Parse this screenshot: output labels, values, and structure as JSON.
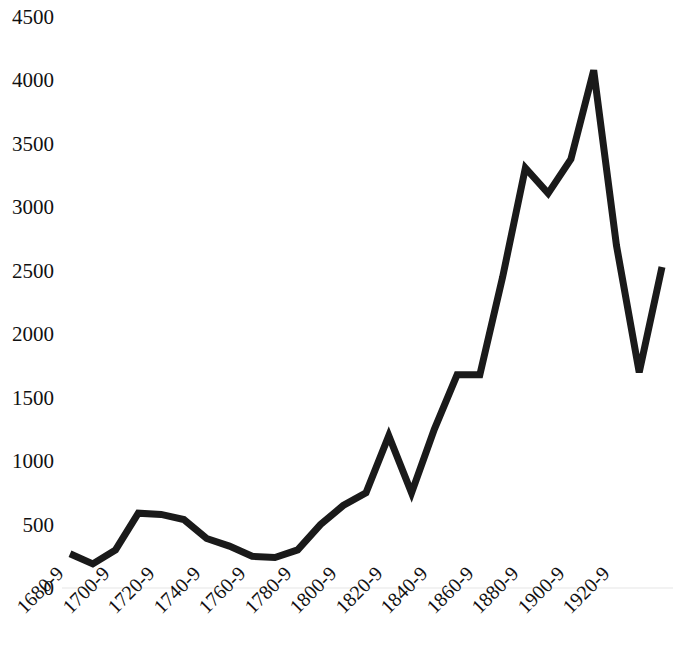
{
  "chart_data": {
    "type": "line",
    "title": "",
    "subtitle": "",
    "xlabel": "",
    "ylabel": "",
    "grid": false,
    "legend": false,
    "legend_position": "none",
    "line_color": "#1a1a1a",
    "background_color": "#ffffff",
    "ylim": [
      0,
      4500
    ],
    "ytick_values": [
      0,
      500,
      1000,
      1500,
      2000,
      2500,
      3000,
      3500,
      4000,
      4500
    ],
    "ytick_labels": [
      "0",
      "500",
      "1000",
      "1500",
      "2000",
      "2500",
      "3000",
      "3500",
      "4000",
      "4500"
    ],
    "xtick_labels": [
      "1680-9",
      "1700-9",
      "1720-9",
      "1740-9",
      "1760-9",
      "1780-9",
      "1800-9",
      "1820-9",
      "1840-9",
      "1860-9",
      "1880-9",
      "1900-9",
      "1920-9"
    ],
    "categories": [
      "1680-9",
      "1690-9",
      "1700-9",
      "1710-9",
      "1720-9",
      "1730-9",
      "1740-9",
      "1750-9",
      "1760-9",
      "1770-9",
      "1780-9",
      "1790-9",
      "1800-9",
      "1810-9",
      "1820-9",
      "1830-9",
      "1840-9",
      "1850-9",
      "1860-9",
      "1870-9",
      "1880-9",
      "1890-9",
      "1900-9",
      "1910-9",
      "1920-9",
      "1930-9"
    ],
    "values": [
      270,
      190,
      300,
      590,
      580,
      540,
      390,
      330,
      250,
      240,
      300,
      500,
      650,
      750,
      1200,
      750,
      1250,
      1680,
      1680,
      2450,
      3310,
      3110,
      3380,
      4080,
      2700,
      1700
    ],
    "series": [
      {
        "name": "Series 1",
        "values": [
          270,
          190,
          300,
          590,
          580,
          540,
          390,
          330,
          250,
          240,
          300,
          500,
          650,
          750,
          1200,
          750,
          1250,
          1680,
          1680,
          2450,
          3310,
          3110,
          3380,
          4080,
          2700,
          1700
        ]
      }
    ],
    "final_value": 2530,
    "annotations": []
  }
}
